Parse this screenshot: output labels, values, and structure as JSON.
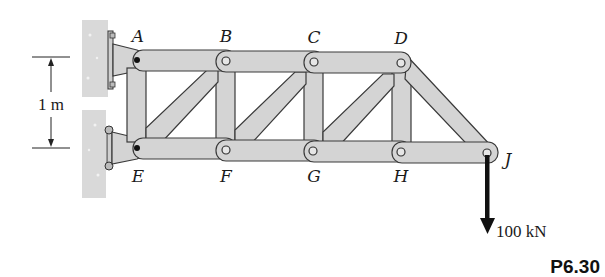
{
  "figure": {
    "problem_id": "P6.30",
    "dimension": {
      "label": "1 m"
    },
    "load": {
      "label": "100 kN",
      "direction": "down",
      "node": "J"
    },
    "nodes": [
      {
        "id": "A",
        "label": "A"
      },
      {
        "id": "B",
        "label": "B"
      },
      {
        "id": "C",
        "label": "C"
      },
      {
        "id": "D",
        "label": "D"
      },
      {
        "id": "E",
        "label": "E"
      },
      {
        "id": "F",
        "label": "F"
      },
      {
        "id": "G",
        "label": "G"
      },
      {
        "id": "H",
        "label": "H"
      },
      {
        "id": "J",
        "label": "J"
      }
    ],
    "supports": [
      {
        "node": "A",
        "type": "pin-wall"
      },
      {
        "node": "E",
        "type": "pin-wall"
      }
    ],
    "colors": {
      "member_fill": "#d4d4d4",
      "member_stroke": "#3a3a3a",
      "wall_fill": "#d9d9d9",
      "arrow": "#111111"
    }
  }
}
